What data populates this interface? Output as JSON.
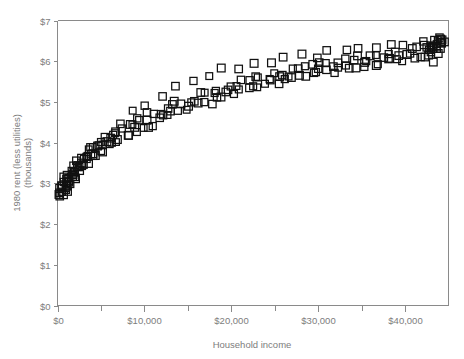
{
  "chart_data": {
    "type": "scatter",
    "title": "",
    "xlabel": "Household income",
    "ylabel_line1": "1980 rent (less utilities)",
    "ylabel_line2": "(thousands)",
    "xlim": [
      0,
      45000
    ],
    "ylim": [
      0,
      7
    ],
    "grid": false,
    "legend": null,
    "marker": "open-square",
    "marker_color": "#111111",
    "axis_color": "#8a8a8a",
    "label_color": "#7d7d7d",
    "background_color": "#ffffff",
    "xticks": [
      0,
      10000,
      20000,
      30000,
      40000
    ],
    "xtick_labels": [
      "$0",
      "$10,000",
      "$20,000",
      "$30,000",
      "$40,000"
    ],
    "xminor_ticks": [
      5000,
      15000,
      25000,
      35000
    ],
    "yticks": [
      0,
      1,
      2,
      3,
      4,
      5,
      6,
      7
    ],
    "ytick_labels": [
      "$0",
      "$1",
      "$2",
      "$3",
      "$4",
      "$5",
      "$6",
      "$7"
    ],
    "x": [
      200,
      350,
      420,
      500,
      560,
      610,
      650,
      700,
      760,
      800,
      850,
      900,
      960,
      1000,
      1060,
      1120,
      1180,
      1240,
      1300,
      1360,
      1420,
      1500,
      1560,
      1620,
      1700,
      1780,
      1850,
      1920,
      2000,
      2080,
      2160,
      2250,
      2340,
      2420,
      2500,
      2600,
      2700,
      2800,
      2900,
      3000,
      3100,
      3200,
      3320,
      3450,
      3580,
      3700,
      3820,
      3950,
      4100,
      4250,
      4400,
      4550,
      4700,
      4850,
      5000,
      5200,
      5400,
      5600,
      5800,
      6000,
      6200,
      6400,
      6600,
      6800,
      7000,
      7250,
      7500,
      7750,
      8000,
      8250,
      8500,
      8750,
      9000,
      9250,
      9500,
      9800,
      10100,
      10400,
      10700,
      11000,
      11300,
      11600,
      11900,
      12200,
      12500,
      12800,
      13100,
      13400,
      13700,
      14000,
      14350,
      14700,
      15050,
      15400,
      15750,
      16100,
      16450,
      16800,
      17150,
      17500,
      17850,
      18200,
      18550,
      18900,
      19250,
      19600,
      19950,
      20300,
      20650,
      21000,
      21350,
      21700,
      22050,
      22400,
      22750,
      23100,
      23450,
      23800,
      24150,
      24500,
      24850,
      25200,
      25550,
      25900,
      26250,
      26600,
      26950,
      27300,
      27650,
      28000,
      28350,
      28700,
      29050,
      29400,
      29750,
      30100,
      30450,
      30800,
      31150,
      31500,
      31850,
      32200,
      32550,
      32900,
      33250,
      33600,
      33950,
      34300,
      34650,
      35000,
      35350,
      35700,
      36050,
      36400,
      36750,
      37100,
      37450,
      37800,
      38150,
      38500,
      38850,
      39200,
      39550,
      39900,
      40250,
      40600,
      40950,
      41300,
      41650,
      42000,
      42200,
      42350,
      42500,
      42650,
      42800,
      42900,
      43000,
      43100,
      43200,
      43300,
      43400,
      43500,
      43600,
      43700,
      43800,
      43850,
      43900,
      43950,
      44000,
      44050,
      1150,
      2350,
      3650,
      5150,
      6900,
      8600,
      10250,
      12050,
      13850,
      15600,
      17300,
      19100,
      20800,
      22600,
      24300,
      26100,
      27800,
      29600,
      31300,
      33100,
      34800,
      36600,
      38300,
      40100,
      41800,
      43000,
      43550,
      43750,
      44100,
      44150
    ],
    "y": [
      2.62,
      2.7,
      2.78,
      2.72,
      2.85,
      2.8,
      2.9,
      2.75,
      2.95,
      2.88,
      3.0,
      2.92,
      3.05,
      2.98,
      3.1,
      3.02,
      2.88,
      3.12,
      3.05,
      2.95,
      3.18,
      3.08,
      3.22,
      3.12,
      3.28,
      3.18,
      3.32,
      3.22,
      3.35,
      3.25,
      3.4,
      3.3,
      3.45,
      3.35,
      3.5,
      3.38,
      3.55,
      3.42,
      3.58,
      3.48,
      3.62,
      3.52,
      3.68,
      3.55,
      3.72,
      3.6,
      3.78,
      3.65,
      3.82,
      3.7,
      3.88,
      3.75,
      3.92,
      3.8,
      3.98,
      3.85,
      4.05,
      3.9,
      4.1,
      3.95,
      4.18,
      4.02,
      4.22,
      4.08,
      4.28,
      4.12,
      4.35,
      4.18,
      4.4,
      4.22,
      4.45,
      4.28,
      4.52,
      4.32,
      4.58,
      4.38,
      4.62,
      4.42,
      4.68,
      4.48,
      4.72,
      4.55,
      4.78,
      4.6,
      4.85,
      4.65,
      4.9,
      4.7,
      4.95,
      4.75,
      5.0,
      4.82,
      5.05,
      4.88,
      5.1,
      4.92,
      5.15,
      4.98,
      5.2,
      5.02,
      5.25,
      5.08,
      5.3,
      5.12,
      5.35,
      5.18,
      5.4,
      5.22,
      5.45,
      5.28,
      5.48,
      5.32,
      5.52,
      5.38,
      5.55,
      5.42,
      5.6,
      5.45,
      5.62,
      5.5,
      5.65,
      5.52,
      5.7,
      5.55,
      5.72,
      5.58,
      5.75,
      5.62,
      5.78,
      5.65,
      5.8,
      5.68,
      5.85,
      5.7,
      5.88,
      5.72,
      5.9,
      5.75,
      5.92,
      5.78,
      5.95,
      5.8,
      5.98,
      5.82,
      6.0,
      5.85,
      6.02,
      5.88,
      6.05,
      5.9,
      6.08,
      5.92,
      6.1,
      5.95,
      6.12,
      5.98,
      6.15,
      6.0,
      6.18,
      6.02,
      6.2,
      6.05,
      6.22,
      6.08,
      6.25,
      6.1,
      6.28,
      6.12,
      6.3,
      6.15,
      6.32,
      6.18,
      6.35,
      6.2,
      6.38,
      6.22,
      6.4,
      6.25,
      6.42,
      6.28,
      6.45,
      6.3,
      6.48,
      6.32,
      6.5,
      6.35,
      6.52,
      6.38,
      6.55,
      6.4,
      2.98,
      3.48,
      3.85,
      4.15,
      4.42,
      4.72,
      4.95,
      5.18,
      5.38,
      5.52,
      5.65,
      5.78,
      5.85,
      5.92,
      5.98,
      6.05,
      6.1,
      6.15,
      6.2,
      6.25,
      6.28,
      6.32,
      6.38,
      6.42,
      6.48,
      6.2,
      6.05,
      6.6,
      6.12,
      6.45
    ]
  }
}
